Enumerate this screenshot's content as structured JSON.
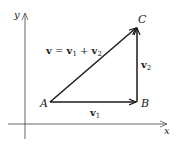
{
  "diagram": {
    "axes": {
      "x_label": "x",
      "y_label": "y"
    },
    "points": [
      {
        "name": "A",
        "x": 50,
        "y": 102
      },
      {
        "name": "B",
        "x": 137,
        "y": 102
      },
      {
        "name": "C",
        "x": 137,
        "y": 27
      }
    ],
    "vectors": {
      "v1": {
        "base": "v",
        "sub": "1",
        "from": "A",
        "to": "B"
      },
      "v2": {
        "base": "v",
        "sub": "2",
        "from": "B",
        "to": "C"
      },
      "v": {
        "base": "v",
        "from": "A",
        "to": "C"
      }
    },
    "equation": {
      "lhs": "v",
      "eq": " = ",
      "t1": "v",
      "t1_sub": "1",
      "plus": " + ",
      "t2": "v",
      "t2_sub": "2"
    },
    "colors": {
      "stroke": "#1a1a1a",
      "axis": "#555555",
      "text": "#222222"
    }
  }
}
